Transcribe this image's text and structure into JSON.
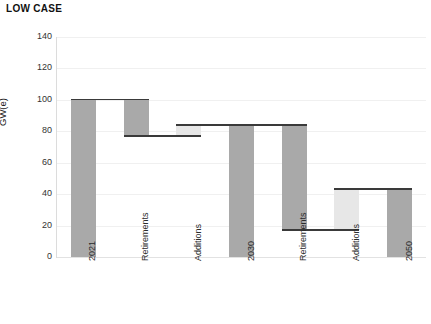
{
  "chart_data": {
    "type": "bar",
    "subtype": "waterfall",
    "title": "LOW CASE",
    "xlabel": "",
    "ylabel": "GW(e)",
    "ylim": [
      0,
      140
    ],
    "ytick_step": 20,
    "ytick_labels": [
      "0",
      "20",
      "40",
      "60",
      "80",
      "100",
      "120",
      "140"
    ],
    "ytick_values": [
      0,
      20,
      40,
      60,
      80,
      100,
      120,
      140
    ],
    "grid": true,
    "legend": "none",
    "categories": [
      "2021",
      "Retirements",
      "Additions",
      "2030",
      "Retirements",
      "Additions",
      "2050"
    ],
    "bar_kinds": [
      "total",
      "decrease",
      "increase",
      "total",
      "decrease",
      "increase",
      "total"
    ],
    "bars": [
      {
        "label": "2021",
        "kind": "total",
        "base": 0,
        "top": 100,
        "value": 100,
        "color": "#a9a9a9"
      },
      {
        "label": "Retirements",
        "kind": "decrease",
        "base": 77,
        "top": 100,
        "value": -23,
        "color": "#a9a9a9"
      },
      {
        "label": "Additions",
        "kind": "increase",
        "base": 77,
        "top": 84,
        "value": 7,
        "color": "#e7e7e7"
      },
      {
        "label": "2030",
        "kind": "total",
        "base": 0,
        "top": 84,
        "value": 84,
        "color": "#a9a9a9"
      },
      {
        "label": "Retirements",
        "kind": "decrease",
        "base": 17,
        "top": 84,
        "value": -67,
        "color": "#a9a9a9"
      },
      {
        "label": "Additions",
        "kind": "increase",
        "base": 17,
        "top": 43,
        "value": 26,
        "color": "#e7e7e7"
      },
      {
        "label": "2050",
        "kind": "total",
        "base": 0,
        "top": 43,
        "value": 43,
        "color": "#a9a9a9"
      }
    ],
    "connector_levels": [
      100,
      77,
      84,
      84,
      17,
      43
    ],
    "colors": {
      "bar_dark": "#a9a9a9",
      "bar_light": "#e7e7e7",
      "connector": "#3a3a3a",
      "gridline": "#f0f0f0",
      "text": "#222222",
      "background": "#ffffff"
    }
  }
}
